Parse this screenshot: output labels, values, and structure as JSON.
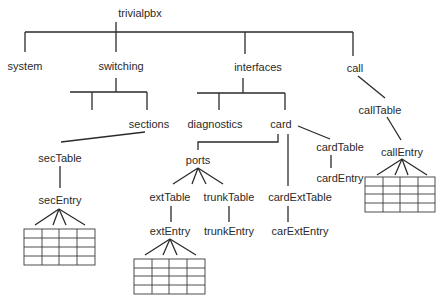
{
  "diagram": {
    "type": "tree",
    "title": "trivialpbx",
    "root": {
      "label": "trivialpbx",
      "children": [
        {
          "label": "system"
        },
        {
          "label": "switching",
          "children": [
            {
              "label": ""
            },
            {
              "label": "sections",
              "children": [
                {
                  "label": "secTable",
                  "children": [
                    {
                      "label": "secEntry",
                      "table": {
                        "rows": 4,
                        "cols": 4
                      }
                    }
                  ]
                }
              ]
            }
          ]
        },
        {
          "label": "interfaces",
          "children": [
            {
              "label": "diagnostics"
            },
            {
              "label": "card",
              "children": [
                {
                  "label": "ports",
                  "children": [
                    {
                      "label": "extTable",
                      "children": [
                        {
                          "label": "extEntry",
                          "table": {
                            "rows": 4,
                            "cols": 4
                          }
                        }
                      ]
                    },
                    {
                      "label": "trunkTable",
                      "children": [
                        {
                          "label": "trunkEntry"
                        }
                      ]
                    }
                  ]
                },
                {
                  "label": "cardExtTable",
                  "children": [
                    {
                      "label": "carExtEntry"
                    }
                  ]
                },
                {
                  "label": "cardTable",
                  "children": [
                    {
                      "label": "cardEntry"
                    }
                  ]
                }
              ]
            }
          ]
        },
        {
          "label": "call",
          "children": [
            {
              "label": "callTable",
              "children": [
                {
                  "label": "callEntry",
                  "table": {
                    "rows": 4,
                    "cols": 4
                  }
                }
              ]
            }
          ]
        }
      ]
    }
  },
  "labels": {
    "trivialpbx": "trivialpbx",
    "system": "system",
    "switching": "switching",
    "interfaces": "interfaces",
    "call": "call",
    "sections": "sections",
    "diagnostics": "diagnostics",
    "card": "card",
    "secTable": "secTable",
    "secEntry": "secEntry",
    "ports": "ports",
    "cardTable": "cardTable",
    "cardEntry": "cardEntry",
    "extTable": "extTable",
    "trunkTable": "trunkTable",
    "cardExtTable": "cardExtTable",
    "extEntry": "extEntry",
    "trunkEntry": "trunkEntry",
    "carExtEntry": "carExtEntry",
    "callTable": "callTable",
    "callEntry": "callEntry"
  },
  "colors": {
    "line": "#2a2a2a",
    "text": "#2a2a2a",
    "background": "#ffffff"
  }
}
